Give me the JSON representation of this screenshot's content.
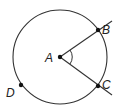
{
  "diagram": {
    "type": "circle-central-angle",
    "circle": {
      "center": "A",
      "cx": 60,
      "cy": 57,
      "r": 47
    },
    "points": [
      {
        "id": "A",
        "label": "A",
        "x": 60,
        "y": 57,
        "role": "center"
      },
      {
        "id": "B",
        "label": "B",
        "x": 98,
        "y": 30,
        "role": "on-circle"
      },
      {
        "id": "C",
        "label": "C",
        "x": 98,
        "y": 86,
        "role": "on-circle"
      },
      {
        "id": "D",
        "label": "D",
        "x": 21,
        "y": 85,
        "role": "on-circle"
      }
    ],
    "rays": [
      {
        "from": "A",
        "through": "B",
        "end": [
          112,
          21
        ]
      },
      {
        "from": "A",
        "through": "C",
        "end": [
          112,
          95
        ]
      }
    ],
    "angle_mark": {
      "vertex": "A",
      "between": [
        "B",
        "C"
      ]
    },
    "colors": {
      "stroke": "#333333",
      "point": "#111111"
    }
  }
}
